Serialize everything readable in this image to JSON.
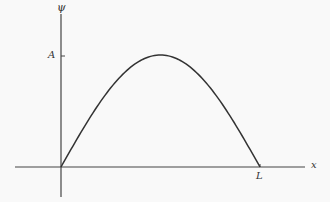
{
  "chart_data": {
    "type": "line",
    "title": "",
    "xlabel": "x",
    "ylabel": "ψ",
    "x_ticks": [
      "L"
    ],
    "y_ticks": [
      "A"
    ],
    "series": [
      {
        "name": "ψ(x) = A sin(πx/L)",
        "x": [
          0,
          0.25,
          0.5,
          0.75,
          1
        ],
        "values": [
          0,
          0.707,
          1,
          0.707,
          0
        ]
      }
    ],
    "xlim": [
      0,
      "L"
    ],
    "ylim": [
      0,
      "A"
    ],
    "grid": false,
    "legend": "none"
  },
  "labels": {
    "y_axis": "ψ",
    "x_axis": "x",
    "amplitude": "A",
    "length": "L"
  },
  "colors": {
    "axis": "#444444",
    "curve": "#333333"
  }
}
